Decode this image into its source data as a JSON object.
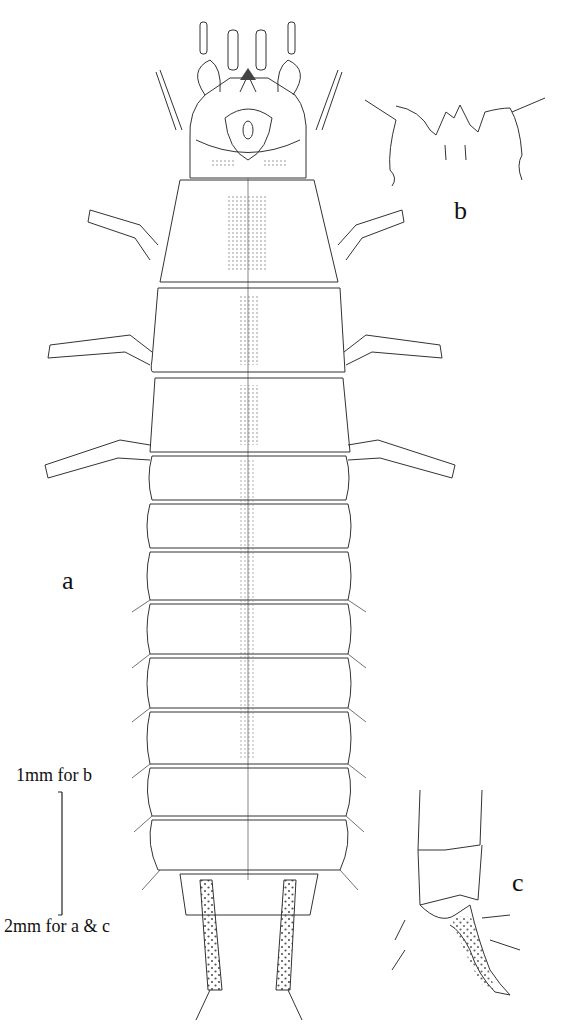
{
  "figure": {
    "panels": [
      {
        "id": "a",
        "label": "a",
        "description": "Larva, dorsal habitus"
      },
      {
        "id": "b",
        "label": "b",
        "description": "Nasale / anterior margin of head, enlarged"
      },
      {
        "id": "c",
        "label": "c",
        "description": "Abdominal apex with urogomphi, lateral view"
      }
    ],
    "scale_bar": {
      "top_label": "1mm for b",
      "bottom_label": "2mm for a & c"
    },
    "colors": {
      "line": "#333333",
      "stipple": "#777777",
      "background": "#ffffff"
    }
  }
}
